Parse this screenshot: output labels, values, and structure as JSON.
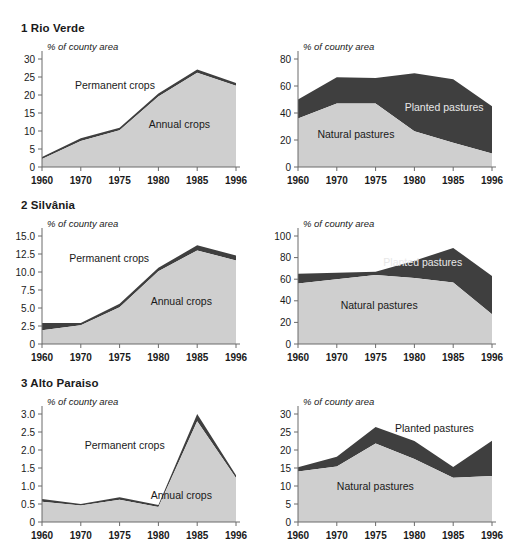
{
  "figure": {
    "background": "#ffffff",
    "colors": {
      "lower_band": "#cfcfcf",
      "upper_band": "#3f3f3f",
      "axis": "#6b6b6b",
      "text": "#1a1a1a"
    }
  },
  "panels": [
    {
      "id": "rio-verde",
      "number": "1",
      "title": "1 Rio Verde",
      "charts": [
        {
          "id": "rio-verde-crops",
          "axis_title": "% of county area",
          "yticks": [
            "30",
            "25",
            "20",
            "15",
            "10",
            "5",
            "0"
          ],
          "xticks": [
            "1960",
            "1970",
            "1975",
            "1980",
            "1985",
            "1996"
          ],
          "labels": {
            "lower": "Annual crops",
            "upper": "Permanent crops"
          },
          "chart_data": {
            "type": "area",
            "title": "1 Rio Verde",
            "xlabel": "",
            "ylabel": "% of county area",
            "ylim": [
              0,
              30
            ],
            "grid": false,
            "legend": "inline",
            "categories": [
              "1960",
              "1970",
              "1975",
              "1980",
              "1985",
              "1996"
            ],
            "series": [
              {
                "name": "Annual crops",
                "values": [
                  2.2,
                  7.2,
                  10.2,
                  19.6,
                  26.2,
                  22.6
                ]
              },
              {
                "name": "Permanent crops",
                "values": [
                  0.6,
                  0.8,
                  0.7,
                  0.8,
                  0.9,
                  0.7
                ]
              }
            ],
            "totals": [
              2.8,
              8.0,
              10.9,
              20.4,
              27.1,
              23.3
            ]
          }
        },
        {
          "id": "rio-verde-pastures",
          "axis_title": "% of county area",
          "yticks": [
            "80",
            "60",
            "40",
            "20",
            "0"
          ],
          "xticks": [
            "1960",
            "1970",
            "1975",
            "1980",
            "1985",
            "1996"
          ],
          "labels": {
            "lower": "Natural pastures",
            "upper": "Planted pastures"
          },
          "chart_data": {
            "type": "area",
            "title": "1 Rio Verde",
            "xlabel": "",
            "ylabel": "% of county area",
            "ylim": [
              0,
              80
            ],
            "grid": false,
            "legend": "inline",
            "categories": [
              "1960",
              "1970",
              "1975",
              "1980",
              "1985",
              "1996"
            ],
            "series": [
              {
                "name": "Natural pastures",
                "values": [
                  36.0,
                  47.0,
                  47.0,
                  26.5,
                  18.0,
                  10.0
                ]
              },
              {
                "name": "Planted pastures",
                "values": [
                  14.0,
                  19.5,
                  19.0,
                  43.0,
                  47.0,
                  35.0
                ]
              }
            ],
            "totals": [
              50.0,
              66.5,
              66.0,
              69.5,
              65.0,
              45.0
            ]
          }
        }
      ]
    },
    {
      "id": "silvania",
      "number": "2",
      "title": "2 Silvânia",
      "charts": [
        {
          "id": "silvania-crops",
          "axis_title": "% of county area",
          "yticks": [
            "15.0",
            "12.5",
            "10.0",
            "7.5",
            "5.0",
            "2.5",
            "0"
          ],
          "xticks": [
            "1960",
            "1970",
            "1975",
            "1980",
            "1985",
            "1996"
          ],
          "labels": {
            "lower": "Annual crops",
            "upper": "Permanent crops"
          },
          "chart_data": {
            "type": "area",
            "title": "2 Silvânia",
            "xlabel": "",
            "ylabel": "% of county area",
            "ylim": [
              0,
              15
            ],
            "grid": false,
            "legend": "inline",
            "categories": [
              "1960",
              "1970",
              "1975",
              "1980",
              "1985",
              "1996"
            ],
            "series": [
              {
                "name": "Annual crops",
                "values": [
                  1.9,
                  2.6,
                  5.1,
                  10.1,
                  13.0,
                  11.6
                ]
              },
              {
                "name": "Permanent crops",
                "values": [
                  1.0,
                  0.3,
                  0.5,
                  0.5,
                  0.7,
                  0.7
                ]
              }
            ],
            "totals": [
              2.9,
              2.9,
              5.6,
              10.6,
              13.7,
              12.3
            ]
          }
        },
        {
          "id": "silvania-pastures",
          "axis_title": "% of county area",
          "yticks": [
            "100",
            "80",
            "60",
            "40",
            "20",
            "0"
          ],
          "xticks": [
            "1960",
            "1970",
            "1975",
            "1980",
            "1985",
            "1996"
          ],
          "labels": {
            "lower": "Natural pastures",
            "upper": "Planted pastures"
          },
          "chart_data": {
            "type": "area",
            "title": "2 Silvânia",
            "xlabel": "",
            "ylabel": "% of county area",
            "ylim": [
              0,
              100
            ],
            "grid": false,
            "legend": "inline",
            "categories": [
              "1960",
              "1970",
              "1975",
              "1980",
              "1985",
              "1996"
            ],
            "series": [
              {
                "name": "Natural pastures",
                "values": [
                  56.0,
                  60.0,
                  64.0,
                  61.0,
                  57.0,
                  27.5
                ]
              },
              {
                "name": "Planted pastures",
                "values": [
                  9.0,
                  6.0,
                  3.0,
                  16.0,
                  32.0,
                  35.5
                ]
              }
            ],
            "totals": [
              65.0,
              66.0,
              67.0,
              77.0,
              89.0,
              63.0
            ]
          }
        }
      ]
    },
    {
      "id": "alto-paraiso",
      "number": "3",
      "title": "3 Alto Paraiso",
      "charts": [
        {
          "id": "alto-paraiso-crops",
          "axis_title": "% of county area",
          "yticks": [
            "3.0",
            "2.5",
            "2.0",
            "1.5",
            "1.0",
            "0.5",
            "0"
          ],
          "xticks": [
            "1960",
            "1970",
            "1975",
            "1980",
            "1985",
            "1996"
          ],
          "labels": {
            "lower": "Annual crops",
            "upper": "Permanent crops"
          },
          "chart_data": {
            "type": "area",
            "title": "3 Alto Paraiso",
            "xlabel": "",
            "ylabel": "% of county area",
            "ylim": [
              0,
              3
            ],
            "grid": false,
            "legend": "inline",
            "categories": [
              "1960",
              "1970",
              "1975",
              "1980",
              "1985",
              "1996"
            ],
            "series": [
              {
                "name": "Annual crops",
                "values": [
                  0.56,
                  0.46,
                  0.62,
                  0.42,
                  2.8,
                  1.22
                ]
              },
              {
                "name": "Permanent crops",
                "values": [
                  0.08,
                  0.04,
                  0.07,
                  0.05,
                  0.2,
                  0.08
                ]
              }
            ],
            "totals": [
              0.64,
              0.5,
              0.69,
              0.47,
              3.0,
              1.3
            ]
          }
        },
        {
          "id": "alto-paraiso-pastures",
          "axis_title": "% of county area",
          "yticks": [
            "30",
            "25",
            "20",
            "15",
            "10",
            "5",
            "0"
          ],
          "xticks": [
            "1960",
            "1970",
            "1975",
            "1980",
            "1985",
            "1996"
          ],
          "labels": {
            "lower": "Natural pastures",
            "upper": "Planted pastures"
          },
          "chart_data": {
            "type": "area",
            "title": "3 Alto Paraiso",
            "xlabel": "",
            "ylabel": "% of county area",
            "ylim": [
              0,
              30
            ],
            "grid": false,
            "legend": "inline",
            "categories": [
              "1960",
              "1970",
              "1975",
              "1980",
              "1985",
              "1996"
            ],
            "series": [
              {
                "name": "Natural pastures",
                "values": [
                  14.0,
                  15.4,
                  21.8,
                  17.5,
                  12.3,
                  12.8
                ]
              },
              {
                "name": "Planted pastures",
                "values": [
                  1.2,
                  2.7,
                  4.6,
                  5.0,
                  3.0,
                  9.8
                ]
              }
            ],
            "totals": [
              15.2,
              18.1,
              26.4,
              22.5,
              15.3,
              22.6
            ]
          }
        }
      ]
    }
  ]
}
